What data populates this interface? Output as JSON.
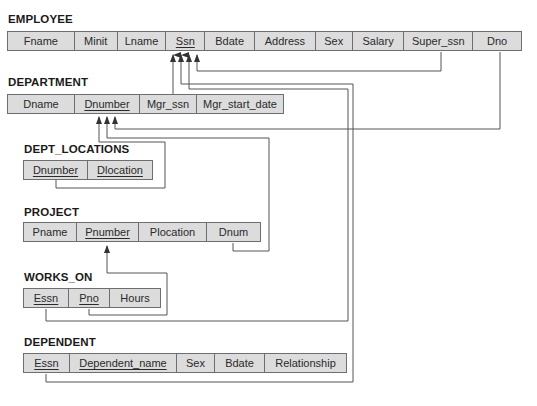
{
  "diagram_type": "relational schema with referential integrity constraints",
  "relations": [
    {
      "name": "EMPLOYEE",
      "attributes": [
        {
          "label": "Fname",
          "pk": false
        },
        {
          "label": "Minit",
          "pk": false
        },
        {
          "label": "Lname",
          "pk": false
        },
        {
          "label": "Ssn",
          "pk": true
        },
        {
          "label": "Bdate",
          "pk": false
        },
        {
          "label": "Address",
          "pk": false
        },
        {
          "label": "Sex",
          "pk": false
        },
        {
          "label": "Salary",
          "pk": false
        },
        {
          "label": "Super_ssn",
          "pk": false
        },
        {
          "label": "Dno",
          "pk": false
        }
      ]
    },
    {
      "name": "DEPARTMENT",
      "attributes": [
        {
          "label": "Dname",
          "pk": false
        },
        {
          "label": "Dnumber",
          "pk": true
        },
        {
          "label": "Mgr_ssn",
          "pk": false
        },
        {
          "label": "Mgr_start_date",
          "pk": false
        }
      ]
    },
    {
      "name": "DEPT_LOCATIONS",
      "attributes": [
        {
          "label": "Dnumber",
          "pk": true
        },
        {
          "label": "Dlocation",
          "pk": true
        }
      ]
    },
    {
      "name": "PROJECT",
      "attributes": [
        {
          "label": "Pname",
          "pk": false
        },
        {
          "label": "Pnumber",
          "pk": true
        },
        {
          "label": "Plocation",
          "pk": false
        },
        {
          "label": "Dnum",
          "pk": false
        }
      ]
    },
    {
      "name": "WORKS_ON",
      "attributes": [
        {
          "label": "Essn",
          "pk": true
        },
        {
          "label": "Pno",
          "pk": true
        },
        {
          "label": "Hours",
          "pk": false
        }
      ]
    },
    {
      "name": "DEPENDENT",
      "attributes": [
        {
          "label": "Essn",
          "pk": true
        },
        {
          "label": "Dependent_name",
          "pk": true
        },
        {
          "label": "Sex",
          "pk": false
        },
        {
          "label": "Bdate",
          "pk": false
        },
        {
          "label": "Relationship",
          "pk": false
        }
      ]
    }
  ],
  "foreign_keys": [
    {
      "from": "EMPLOYEE.Super_ssn",
      "to": "EMPLOYEE.Ssn"
    },
    {
      "from": "EMPLOYEE.Dno",
      "to": "DEPARTMENT.Dnumber"
    },
    {
      "from": "DEPARTMENT.Mgr_ssn",
      "to": "EMPLOYEE.Ssn"
    },
    {
      "from": "DEPT_LOCATIONS.Dnumber",
      "to": "DEPARTMENT.Dnumber"
    },
    {
      "from": "PROJECT.Dnum",
      "to": "DEPARTMENT.Dnumber"
    },
    {
      "from": "WORKS_ON.Essn",
      "to": "EMPLOYEE.Ssn"
    },
    {
      "from": "WORKS_ON.Pno",
      "to": "PROJECT.Pnumber"
    },
    {
      "from": "DEPENDENT.Essn",
      "to": "EMPLOYEE.Ssn"
    }
  ],
  "colors": {
    "cell_fill": "#dcdcdc",
    "border": "#6e6e6e",
    "line": "#555555",
    "text": "#2a2a2a"
  }
}
